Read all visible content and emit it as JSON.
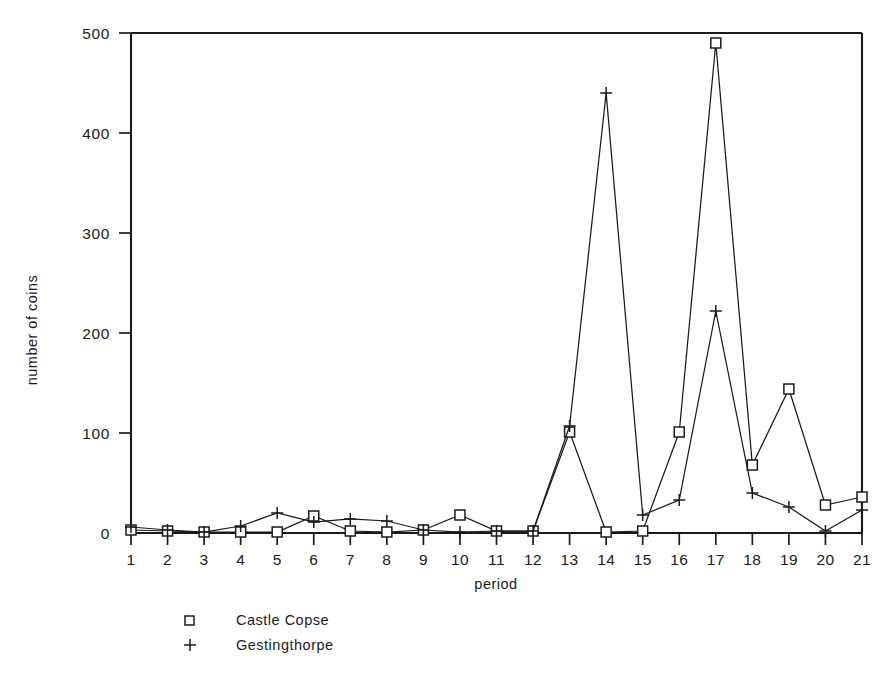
{
  "chart_data": {
    "type": "line",
    "title": "",
    "xlabel": "period",
    "ylabel": "number of coins",
    "categories": [
      "1",
      "2",
      "3",
      "4",
      "5",
      "6",
      "7",
      "8",
      "9",
      "10",
      "11",
      "12",
      "13",
      "14",
      "15",
      "16",
      "17",
      "18",
      "19",
      "20",
      "21"
    ],
    "x": [
      1,
      2,
      3,
      4,
      5,
      6,
      7,
      8,
      9,
      10,
      11,
      12,
      13,
      14,
      15,
      16,
      17,
      18,
      19,
      20,
      21
    ],
    "xlim": [
      1,
      21
    ],
    "ylim": [
      0,
      500
    ],
    "grid": false,
    "legend_position": "below-axes-left",
    "yticks": [
      0,
      100,
      200,
      300,
      400,
      500
    ],
    "ytick_labels": [
      "0",
      "100",
      "200",
      "300",
      "400",
      "500"
    ],
    "xticks": [
      1,
      2,
      3,
      4,
      5,
      6,
      7,
      8,
      9,
      10,
      11,
      12,
      13,
      14,
      15,
      16,
      17,
      18,
      19,
      20,
      21
    ],
    "xtick_labels": [
      "1",
      "2",
      "3",
      "4",
      "5",
      "6",
      "7",
      "8",
      "9",
      "10",
      "11",
      "12",
      "13",
      "14",
      "15",
      "16",
      "17",
      "18",
      "19",
      "20",
      "21"
    ],
    "series": [
      {
        "name": "Castle Copse",
        "marker": "square",
        "values": [
          3,
          2,
          1,
          1,
          1,
          17,
          2,
          1,
          3,
          18,
          2,
          2,
          101,
          1,
          2,
          101,
          490,
          68,
          144,
          28,
          36
        ]
      },
      {
        "name": "Gestingthorpe",
        "marker": "plus",
        "values": [
          6,
          3,
          1,
          7,
          20,
          11,
          14,
          12,
          3,
          1,
          2,
          2,
          107,
          440,
          18,
          33,
          222,
          40,
          26,
          2,
          23
        ]
      }
    ]
  },
  "legend": {
    "entries": [
      {
        "marker": "square",
        "label": "Castle Copse"
      },
      {
        "marker": "plus",
        "label": "Gestingthorpe"
      }
    ]
  },
  "axes": {
    "y_title": "number of coins",
    "x_title": "period"
  },
  "caption": {
    "text": ""
  },
  "colors": {
    "ink": "#1a1a1a",
    "background": "#ffffff"
  }
}
